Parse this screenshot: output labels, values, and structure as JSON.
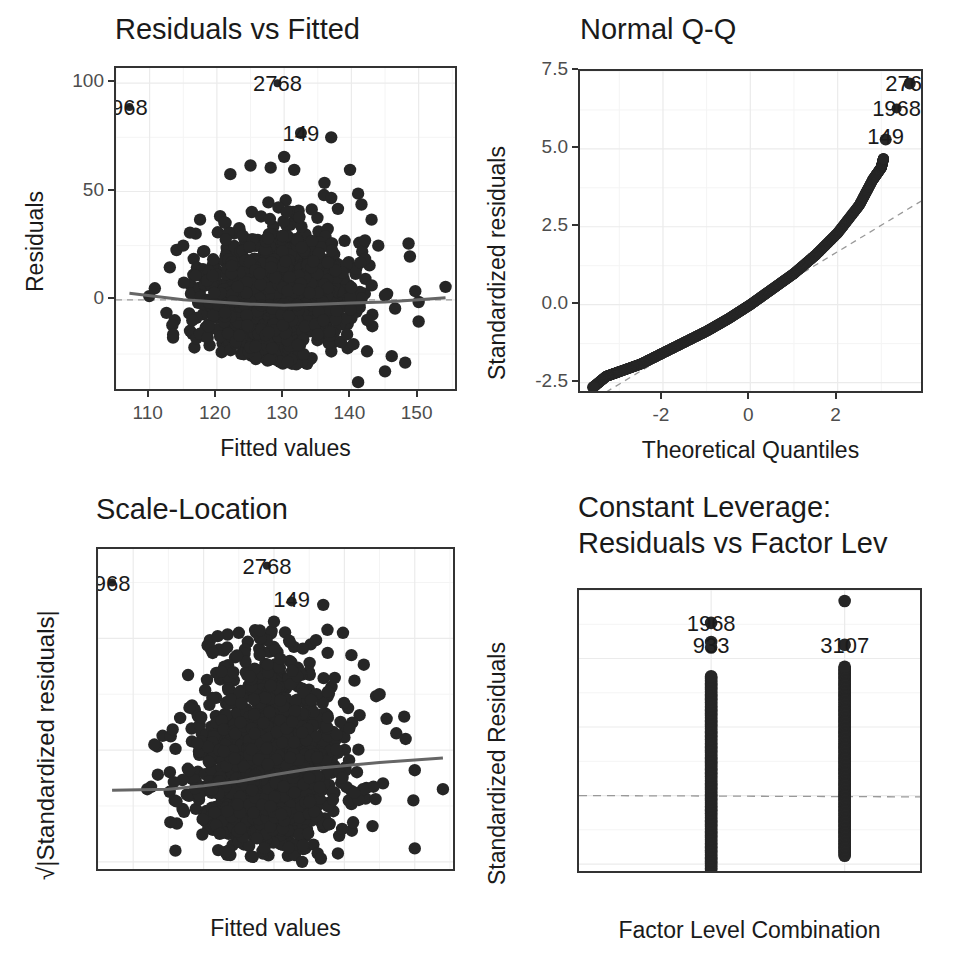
{
  "colors": {
    "points": "#262626",
    "smooth_line": "#666666",
    "ref_line": "#999999",
    "grid": "#ebebeb",
    "frame": "#333333"
  },
  "panels": {
    "p1": {
      "title": "Residuals vs Fitted",
      "xlabel": "Fitted values",
      "ylabel": "Residuals",
      "xticks": [
        "110",
        "120",
        "130",
        "140",
        "150"
      ],
      "yticks": [
        "0",
        "50",
        "100"
      ]
    },
    "p2": {
      "title": "Normal Q-Q",
      "xlabel": "Theoretical Quantiles",
      "ylabel": "Standardized residuals",
      "xticks": [
        "-2",
        "0",
        "2"
      ],
      "yticks": [
        "-2.5",
        "0.0",
        "2.5",
        "5.0",
        "7.5"
      ]
    },
    "p3": {
      "title": "Scale-Location",
      "xlabel": "Fitted values",
      "ylabel": "√|Standardized residuals|",
      "xticks": [
        "110",
        "120",
        "130",
        "140",
        "150"
      ],
      "yticks": [
        "0",
        "1",
        "2"
      ]
    },
    "p4": {
      "title_line1": "Constant Leverage:",
      "title_line2": "Residuals vs Factor Lev",
      "xlabel": "Factor Level Combination",
      "ylabel": "Standardized Residuals",
      "xticks": [
        "A",
        "B"
      ],
      "yticks": [
        "-2.5",
        "0.0",
        "2.5",
        "5.0",
        "7.5"
      ]
    }
  },
  "chart_data": [
    {
      "type": "scatter",
      "title": "Residuals vs Fitted",
      "xlabel": "Fitted values",
      "ylabel": "Residuals",
      "xlim": [
        105,
        156
      ],
      "ylim": [
        -43,
        107
      ],
      "xticks": [
        110,
        120,
        130,
        140,
        150
      ],
      "yticks": [
        0,
        50,
        100
      ],
      "grid": true,
      "reference_line": {
        "type": "hline",
        "y": 0,
        "style": "dashed"
      },
      "smooth_line": {
        "x": [
          107,
          115,
          125,
          130,
          135,
          140,
          145,
          150,
          154
        ],
        "y": [
          3,
          0,
          -2,
          -2.5,
          -2,
          -1.5,
          -1,
          0,
          1
        ]
      },
      "cloud": {
        "x_range": [
          112,
          154
        ],
        "y_range": [
          -38,
          75
        ],
        "dense_center_x": [
          120,
          138
        ],
        "dense_center_y": [
          -30,
          40
        ]
      },
      "labeled_points": [
        {
          "label": "968",
          "x": 107,
          "y": 89
        },
        {
          "label": "2768",
          "x": 129,
          "y": 100
        },
        {
          "label": "149",
          "x": 132.5,
          "y": 77
        }
      ]
    },
    {
      "type": "scatter",
      "title": "Normal Q-Q",
      "xlabel": "Theoretical Quantiles",
      "ylabel": "Standardized residuals",
      "xlim": [
        -3.9,
        4.0
      ],
      "ylim": [
        -2.9,
        7.5
      ],
      "xticks": [
        -2,
        0,
        2
      ],
      "yticks": [
        -2.5,
        0.0,
        2.5,
        5.0,
        7.5
      ],
      "grid": true,
      "reference_line": {
        "type": "abline",
        "intercept": 0,
        "slope": 0.85,
        "style": "dashed"
      },
      "curve": {
        "x": [
          -3.6,
          -3.3,
          -3,
          -2.5,
          -2,
          -1.5,
          -1,
          -0.5,
          0,
          0.5,
          1,
          1.5,
          2,
          2.5,
          2.8,
          3.0,
          3.05
        ],
        "y": [
          -2.65,
          -2.3,
          -2.15,
          -1.9,
          -1.55,
          -1.2,
          -0.85,
          -0.45,
          0.0,
          0.5,
          1.0,
          1.6,
          2.3,
          3.2,
          4.0,
          4.4,
          4.7
        ]
      },
      "labeled_points": [
        {
          "label": "2768",
          "x": 3.65,
          "y": 7.1
        },
        {
          "label": "1968",
          "x": 3.35,
          "y": 6.3
        },
        {
          "label": "149",
          "x": 3.1,
          "y": 5.4
        }
      ]
    },
    {
      "type": "scatter",
      "title": "Scale-Location",
      "xlabel": "Fitted values",
      "ylabel": "√|Standardized residuals|",
      "xlim": [
        105,
        156
      ],
      "ylim": [
        -0.1,
        2.8
      ],
      "xticks": [
        110,
        120,
        130,
        140,
        150
      ],
      "yticks": [
        0,
        1,
        2
      ],
      "grid": true,
      "smooth_line": {
        "x": [
          107,
          115,
          120,
          125,
          130,
          135,
          140,
          145,
          154
        ],
        "y": [
          0.64,
          0.65,
          0.68,
          0.72,
          0.78,
          0.83,
          0.86,
          0.89,
          0.93
        ]
      },
      "cloud": {
        "x_range": [
          112,
          154
        ],
        "y_range": [
          0.0,
          2.3
        ]
      },
      "labeled_points": [
        {
          "label": "968",
          "x": 107,
          "y": 2.5
        },
        {
          "label": "2768",
          "x": 129,
          "y": 2.65
        },
        {
          "label": "149",
          "x": 132.5,
          "y": 2.35
        }
      ]
    },
    {
      "type": "scatter",
      "title": "Constant Leverage:\nResiduals vs Factor Lev",
      "xlabel": "Factor Level Combination",
      "ylabel": "Standardized Residuals",
      "categories": [
        "A",
        "B"
      ],
      "ylim": [
        -2.9,
        7.5
      ],
      "yticks": [
        -2.5,
        0.0,
        2.5,
        5.0,
        7.5
      ],
      "grid": true,
      "reference_line": {
        "type": "hline",
        "y": 0,
        "style": "dashed"
      },
      "series": [
        {
          "name": "A",
          "range": [
            -2.7,
            4.35
          ],
          "outliers": [
            5.4,
            5.6,
            6.3
          ]
        },
        {
          "name": "B",
          "range": [
            -2.2,
            4.7
          ],
          "outliers": [
            5.5,
            7.1
          ]
        }
      ],
      "labeled_points": [
        {
          "label": "1968",
          "category": "A",
          "y": 6.3
        },
        {
          "label": "933",
          "category": "A",
          "y": 5.5
        },
        {
          "label": "3107",
          "category": "B",
          "y": 5.5
        }
      ]
    }
  ]
}
